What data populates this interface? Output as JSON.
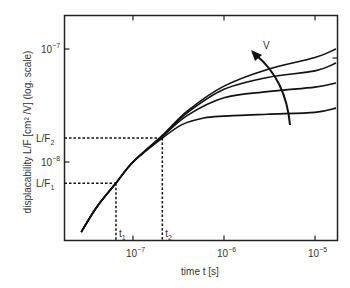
{
  "chart_data": {
    "type": "line",
    "title": "",
    "xlabel": "time t [s]",
    "ylabel": "displacability L/F [cm² /V] (log. scale)",
    "xscale": "log",
    "yscale": "log",
    "xlim": [
      1.9e-08,
      1.7e-05
    ],
    "ylim": [
      2.4e-09,
      1.4e-07
    ],
    "grid": false,
    "x_ticks": [
      {
        "value": 1e-07,
        "base": "10",
        "exp": "−7"
      },
      {
        "value": 1e-06,
        "base": "10",
        "exp": "−6"
      },
      {
        "value": 1e-05,
        "base": "10",
        "exp": "−5"
      }
    ],
    "y_ticks": [
      {
        "value": 1e-07,
        "base": "10",
        "exp": "−7"
      },
      {
        "value": 1e-08,
        "base": "10",
        "exp": "−8"
      }
    ],
    "markers": {
      "L_F1": {
        "label": "L/F",
        "sub": "1",
        "value": 6.5e-09
      },
      "L_F2": {
        "label": "L/F",
        "sub": "2",
        "value": 1.63e-08
      },
      "t1": {
        "label": "t",
        "sub": "1",
        "value": 6.5e-08
      },
      "t2": {
        "label": "t",
        "sub": "2",
        "value": 2.1e-07
      }
    },
    "annotation": {
      "label": "V",
      "note": "arrow indicating increasing V across curves"
    },
    "series": [
      {
        "name": "V1 (lowest)",
        "x": [
          2.7e-08,
          4e-08,
          6.5e-08,
          1e-07,
          2.1e-07,
          3.5e-07,
          6e-07,
          1e-06,
          3e-06,
          1e-05,
          1.7e-05
        ],
        "y": [
          2.4e-09,
          4e-09,
          6.5e-09,
          1e-08,
          1.63e-08,
          2.15e-08,
          2.45e-08,
          2.55e-08,
          2.65e-08,
          2.75e-08,
          3e-08
        ]
      },
      {
        "name": "V2",
        "x": [
          2.7e-08,
          4e-08,
          6.5e-08,
          1e-07,
          2.1e-07,
          4e-07,
          1e-06,
          3e-06,
          1e-05,
          1.7e-05
        ],
        "y": [
          2.4e-09,
          4e-09,
          6.5e-09,
          1e-08,
          1.68e-08,
          2.6e-08,
          3.7e-08,
          4.2e-08,
          4.6e-08,
          5e-08
        ]
      },
      {
        "name": "V3",
        "x": [
          2.7e-08,
          4e-08,
          6.5e-08,
          1e-07,
          2.1e-07,
          4e-07,
          1e-06,
          3e-06,
          1e-05,
          1.7e-05
        ],
        "y": [
          2.4e-09,
          4e-09,
          6.5e-09,
          1e-08,
          1.7e-08,
          2.75e-08,
          4.4e-08,
          5.6e-08,
          6.4e-08,
          7.5e-08
        ]
      },
      {
        "name": "V4 (highest)",
        "x": [
          2.7e-08,
          4e-08,
          6.5e-08,
          1e-07,
          2.1e-07,
          4e-07,
          1e-06,
          3e-06,
          1e-05,
          1.7e-05
        ],
        "y": [
          2.4e-09,
          4e-09,
          6.5e-09,
          1e-08,
          1.72e-08,
          2.85e-08,
          4.7e-08,
          6.6e-08,
          8.4e-08,
          1e-07
        ]
      }
    ]
  }
}
